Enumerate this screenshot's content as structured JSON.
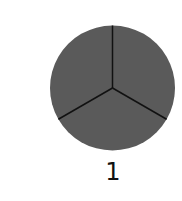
{
  "fraction_diagram": {
    "shape": "circle",
    "total_parts": 3,
    "shaded_parts": 3,
    "fill_color": "#5a5a5a",
    "divider_color": "#111111",
    "label": "1"
  }
}
